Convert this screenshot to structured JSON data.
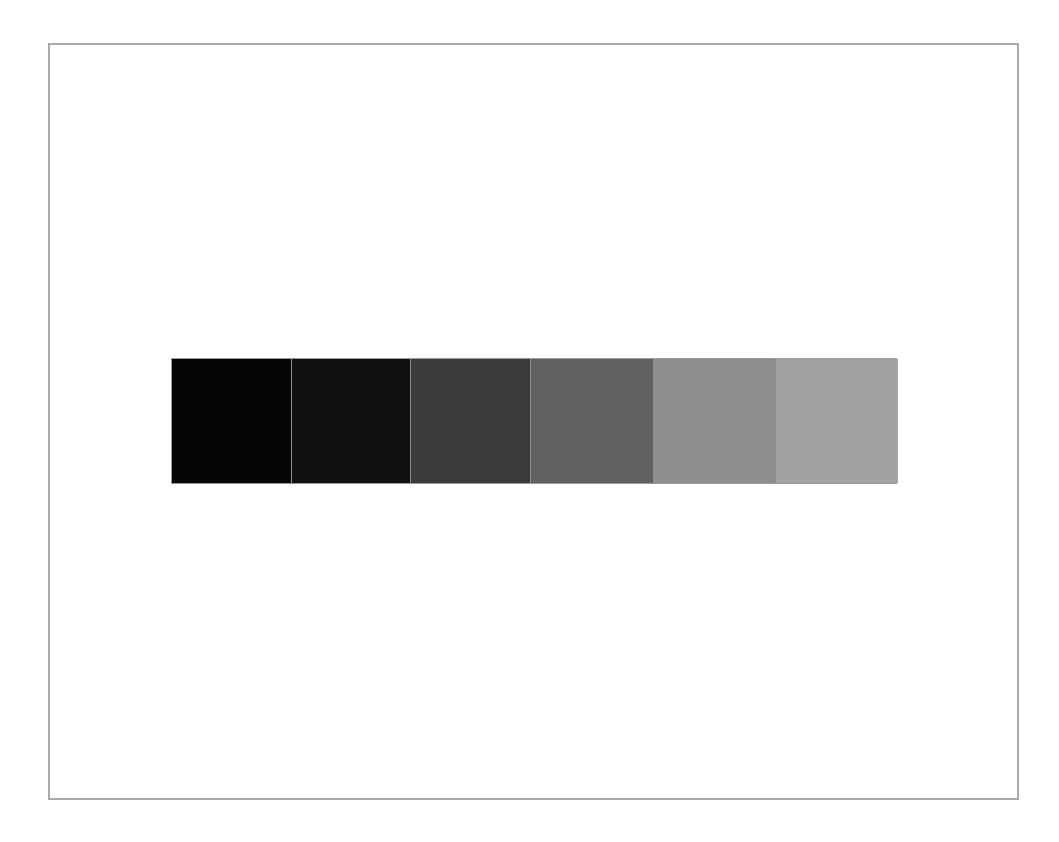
{
  "frame": {
    "border_color": "#a9a9a9",
    "background": "#ffffff"
  },
  "swatches": [
    {
      "index": 1,
      "color": "#050505",
      "width": 119
    },
    {
      "index": 2,
      "color": "#111111",
      "width": 119
    },
    {
      "index": 3,
      "color": "#3c3c3c",
      "width": 120
    },
    {
      "index": 4,
      "color": "#616161",
      "width": 123
    },
    {
      "index": 5,
      "color": "#8f8f8f",
      "width": 122
    },
    {
      "index": 6,
      "color": "#a2a2a2",
      "width": 123
    }
  ]
}
